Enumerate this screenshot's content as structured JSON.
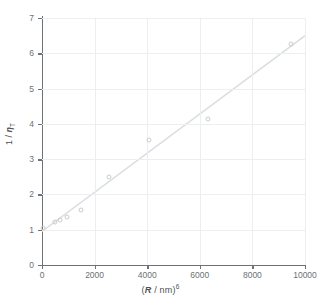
{
  "chart_data": {
    "type": "scatter",
    "title": "",
    "xlabel": "(R / nm)⁶",
    "xlabel_parts": {
      "prefix": "(",
      "variable": "R",
      "middle": " / nm)",
      "exponent": "6"
    },
    "ylabel": "1 / ηₜ",
    "ylabel_parts": {
      "prefix": "1 / ",
      "variable": "η",
      "subscript": "T"
    },
    "xlim": [
      0,
      10000
    ],
    "ylim": [
      0,
      7
    ],
    "xticks": [
      0,
      2000,
      4000,
      6000,
      8000,
      10000
    ],
    "yticks": [
      0,
      1,
      2,
      3,
      4,
      5,
      6,
      7
    ],
    "xtick_labels": [
      "0",
      "2000",
      "4000",
      "6000",
      "8000",
      "10000"
    ],
    "ytick_labels": [
      "0",
      "1",
      "2",
      "3",
      "4",
      "5",
      "6",
      "7"
    ],
    "grid": true,
    "legend": null,
    "marker": "open-circle",
    "points": [
      {
        "x": 30,
        "y": 1.05
      },
      {
        "x": 500,
        "y": 1.22
      },
      {
        "x": 700,
        "y": 1.28
      },
      {
        "x": 950,
        "y": 1.35
      },
      {
        "x": 1500,
        "y": 1.55
      },
      {
        "x": 2550,
        "y": 2.5
      },
      {
        "x": 4050,
        "y": 3.55
      },
      {
        "x": 6300,
        "y": 4.15
      },
      {
        "x": 9450,
        "y": 6.25
      }
    ],
    "fit_line": {
      "type": "linear",
      "x_start": 0,
      "y_start": 0.95,
      "x_end": 10000,
      "y_end": 6.5,
      "color": "#dcdfe1"
    },
    "colors": {
      "grid": "#eceef0",
      "axis": "#6e7276",
      "marker_edge": "#c9ccce",
      "text": "#6d7174",
      "background": "#ffffff"
    }
  }
}
